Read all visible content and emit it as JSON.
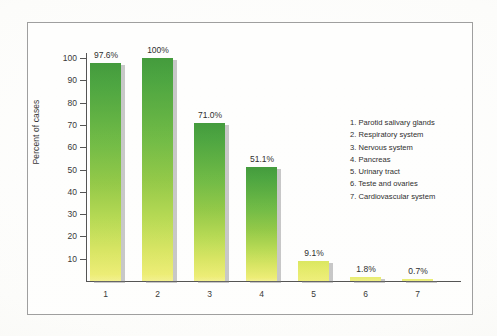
{
  "figure": {
    "y_axis_title": "Percent of cases",
    "frame_color": "#9a9a9a",
    "background_color": "#fefefd"
  },
  "chart_data": {
    "type": "bar",
    "title": "",
    "xlabel": "",
    "ylabel": "Percent of cases",
    "ylim": [
      0,
      105
    ],
    "yticks": [
      10,
      20,
      30,
      40,
      50,
      60,
      70,
      80,
      90,
      100
    ],
    "grid": false,
    "legend_position": "right-inside",
    "categories": [
      "1",
      "2",
      "3",
      "4",
      "5",
      "6",
      "7"
    ],
    "values": [
      97.6,
      100,
      71.0,
      51.1,
      9.1,
      1.8,
      0.7
    ],
    "data_labels": [
      "97.6%",
      "100%",
      "71.0%",
      "51.1%",
      "9.1%",
      "1.8%",
      "0.7%"
    ],
    "category_names": [
      "Parotid salivary glands",
      "Respiratory system",
      "Nervous system",
      "Pancreas",
      "Urinary tract",
      "Teste and ovaries",
      "Cardiovascular system"
    ],
    "bar_gradient": {
      "top": "#3a9633",
      "middle": "#8ec63f",
      "bottom": "#eeee74"
    }
  },
  "legend": {
    "items": [
      "1. Parotid salivary glands",
      "2. Respiratory system",
      "3. Nervous system",
      "4. Pancreas",
      "5. Urinary tract",
      "6. Teste and ovaries",
      "7. Cardiovascular system"
    ]
  }
}
